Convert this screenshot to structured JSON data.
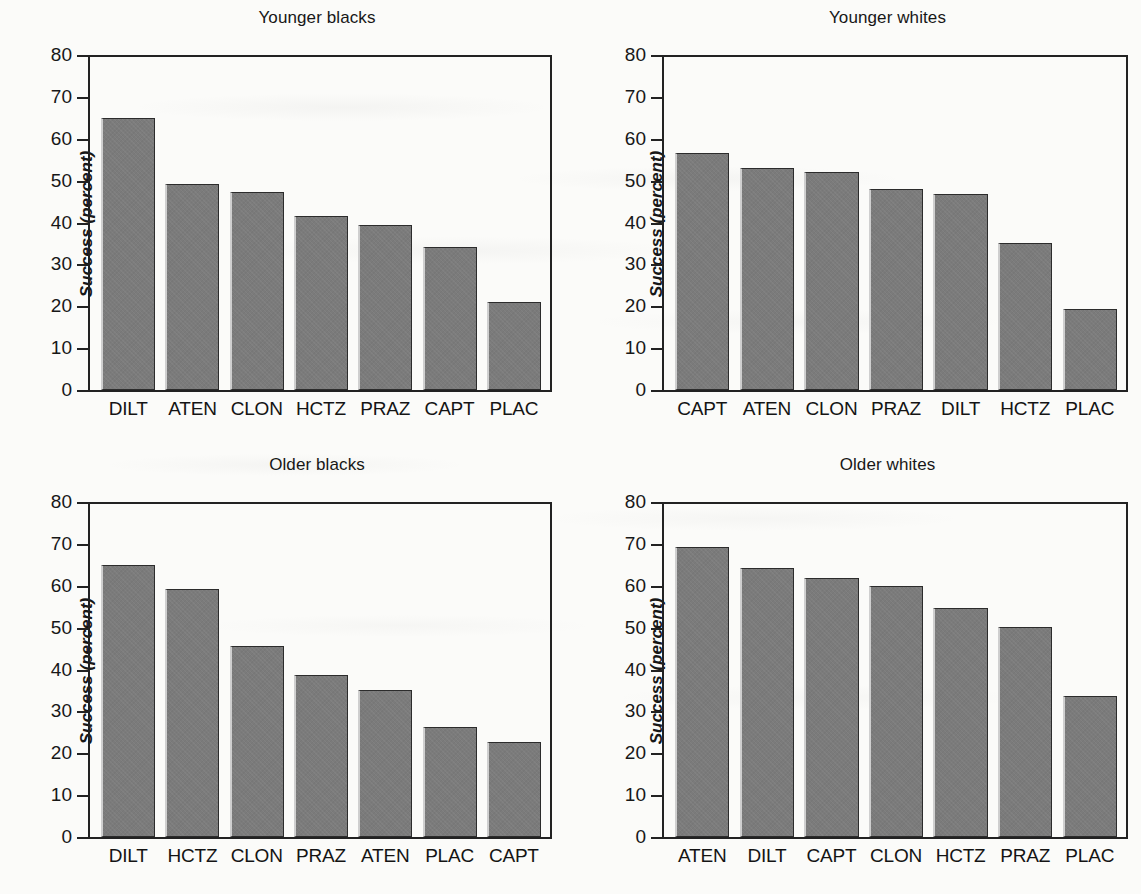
{
  "figure": {
    "ylabel": "Success (percent)",
    "bar_color": "#7b7b7b",
    "bar_edge_color": "#2c2c2c",
    "axis_color": "#222222",
    "background": "#fbfbf9"
  },
  "yaxis": {
    "ticks": [
      0,
      10,
      20,
      30,
      40,
      50,
      60,
      70,
      80
    ],
    "labels": [
      "0",
      "10",
      "20",
      "30",
      "40",
      "50",
      "60",
      "70",
      "80"
    ],
    "min": 0,
    "max": 80
  },
  "chart_data": [
    {
      "type": "bar",
      "title": "Younger blacks",
      "xlabel": "",
      "ylabel": "Success (percent)",
      "ylim": [
        0,
        80
      ],
      "grid": false,
      "legend": "none",
      "categories": [
        "DILT",
        "ATEN",
        "CLON",
        "HCTZ",
        "PRAZ",
        "CAPT",
        "PLAC"
      ],
      "values": [
        65.0,
        49.1,
        47.3,
        41.6,
        39.5,
        34.1,
        21.0
      ]
    },
    {
      "type": "bar",
      "title": "Younger whites",
      "xlabel": "",
      "ylabel": "Success (percent)",
      "ylim": [
        0,
        80
      ],
      "grid": false,
      "legend": "none",
      "categories": [
        "CAPT",
        "ATEN",
        "CLON",
        "PRAZ",
        "DILT",
        "HCTZ",
        "PLAC"
      ],
      "values": [
        56.7,
        53.1,
        52.1,
        48.0,
        46.9,
        35.0,
        19.3
      ]
    },
    {
      "type": "bar",
      "title": "Older blacks",
      "xlabel": "",
      "ylabel": "Success (percent)",
      "ylim": [
        0,
        80
      ],
      "grid": false,
      "legend": "none",
      "categories": [
        "DILT",
        "HCTZ",
        "CLON",
        "PRAZ",
        "ATEN",
        "PLAC",
        "CAPT"
      ],
      "values": [
        64.9,
        59.3,
        45.7,
        38.7,
        35.2,
        26.3,
        22.8
      ]
    },
    {
      "type": "bar",
      "title": "Older whites",
      "xlabel": "",
      "ylabel": "Success (percent)",
      "ylim": [
        0,
        80
      ],
      "grid": false,
      "legend": "none",
      "categories": [
        "ATEN",
        "DILT",
        "CAPT",
        "CLON",
        "HCTZ",
        "PRAZ",
        "PLAC"
      ],
      "values": [
        69.2,
        64.3,
        61.9,
        60.0,
        54.6,
        50.1,
        33.6
      ]
    }
  ]
}
